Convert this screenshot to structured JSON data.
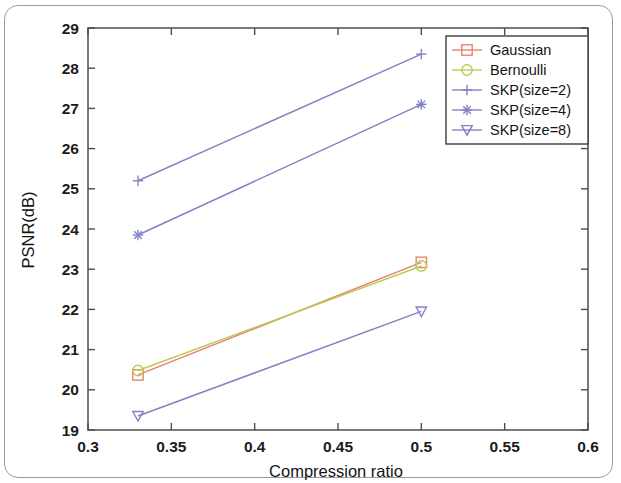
{
  "figure": {
    "kind": "line-chart-figure",
    "has_outer_border": true
  },
  "chart_data": {
    "type": "line",
    "title": "",
    "subtitle": "",
    "xlabel": "Compression ratio",
    "ylabel": "PSNR(dB)",
    "xlim": [
      0.3,
      0.6
    ],
    "ylim": [
      19,
      29
    ],
    "xticks": [
      0.3,
      0.35,
      0.4,
      0.45,
      0.5,
      0.55,
      0.6
    ],
    "xticklabels": [
      "0.3",
      "0.35",
      "0.4",
      "0.45",
      "0.5",
      "0.55",
      "0.6"
    ],
    "yticks": [
      19,
      20,
      21,
      22,
      23,
      24,
      25,
      26,
      27,
      28,
      29
    ],
    "yticklabels": [
      "19",
      "20",
      "21",
      "22",
      "23",
      "24",
      "25",
      "26",
      "27",
      "28",
      "29"
    ],
    "grid": false,
    "legend_position": "upper right",
    "x": [
      0.33,
      0.5
    ],
    "series": [
      {
        "name": "Gaussian",
        "marker": "square",
        "color": "#e8836b",
        "values": [
          20.37,
          23.17
        ]
      },
      {
        "name": "Bernoulli",
        "marker": "circle",
        "color": "#b9cc5a",
        "values": [
          20.48,
          23.08
        ]
      },
      {
        "name": "SKP(size=2)",
        "marker": "plus",
        "color": "#8183c4",
        "values": [
          25.2,
          28.35
        ]
      },
      {
        "name": "SKP(size=4)",
        "marker": "asterisk",
        "color": "#8183c4",
        "values": [
          23.85,
          27.1
        ]
      },
      {
        "name": "SKP(size=8)",
        "marker": "triangle-down",
        "color": "#8183c4",
        "values": [
          19.35,
          21.95
        ]
      }
    ]
  }
}
